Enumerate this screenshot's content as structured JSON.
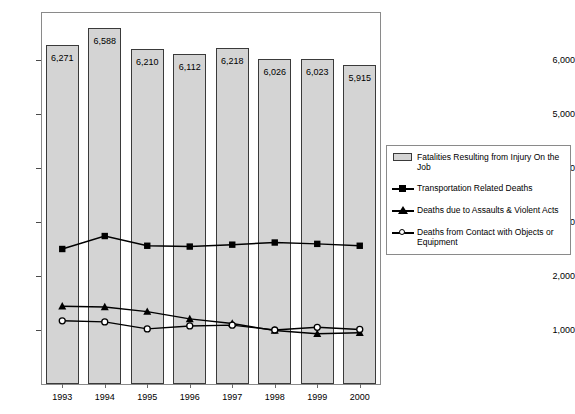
{
  "chart_data": {
    "type": "bar",
    "title": "",
    "xlabel": "",
    "ylabel": "",
    "grid": false,
    "legend_position": "right",
    "categories": [
      "1993",
      "1994",
      "1995",
      "1996",
      "1997",
      "1998",
      "1999",
      "2000"
    ],
    "ylim": [
      0,
      6800
    ],
    "yticks": [
      1000,
      2000,
      3000,
      4000,
      5000,
      6000
    ],
    "ytick_labels": [
      "1,000",
      "2,000",
      "3,000",
      "4,000",
      "5,000",
      "6,000"
    ],
    "series": [
      {
        "name": "Fatalities Resulting from Injury On the Job",
        "render": "bar",
        "marker": "bar-swatch",
        "values": [
          6271,
          6588,
          6210,
          6112,
          6218,
          6026,
          6023,
          5915
        ],
        "data_labels": [
          "6,271",
          "6,588",
          "6,210",
          "6,112",
          "6,218",
          "6,026",
          "6,023",
          "5,915"
        ]
      },
      {
        "name": "Transportation Related Deaths",
        "render": "line",
        "marker": "filled-square",
        "values": [
          2500,
          2740,
          2560,
          2545,
          2580,
          2620,
          2595,
          2560
        ]
      },
      {
        "name": "Deaths due to Assaults & Violent Acts",
        "render": "line",
        "marker": "filled-triangle",
        "values": [
          1440,
          1425,
          1340,
          1205,
          1120,
          990,
          930,
          950
        ]
      },
      {
        "name": "Deaths from Contact with Objects or Equipment",
        "render": "line",
        "marker": "open-circle",
        "values": [
          1170,
          1150,
          1020,
          1075,
          1090,
          1000,
          1050,
          1010
        ]
      }
    ]
  },
  "legend": {
    "items": [
      {
        "label": "Fatalities Resulting from Injury On the Job",
        "key": "bar-swatch"
      },
      {
        "label": "Transportation Related Deaths",
        "key": "filled-square"
      },
      {
        "label": "Deaths due to Assaults & Violent Acts",
        "key": "filled-triangle"
      },
      {
        "label": "Deaths from Contact with Objects or Equipment",
        "key": "open-circle"
      }
    ]
  },
  "caption_remnant": ""
}
